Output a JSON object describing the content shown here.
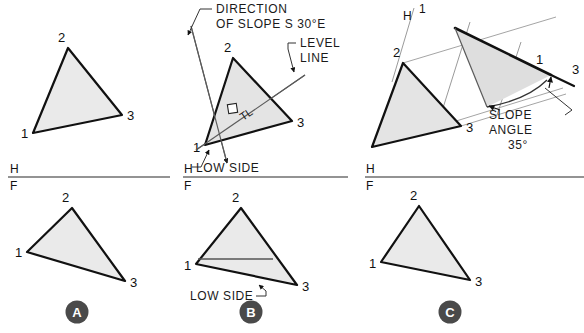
{
  "figure": {
    "panels": [
      {
        "key": "A",
        "badge": "A",
        "caption": "Given plane 1-2-3"
      },
      {
        "key": "B",
        "badge": "B",
        "caption": "Level line and direction of slope"
      },
      {
        "key": "C",
        "badge": "C",
        "caption": "Edge view and slope angle"
      }
    ]
  },
  "colors": {
    "plane_fill": "#e9e9e9",
    "plane_fill_dark": "#dcdcdc",
    "outline": "#111111",
    "thin_line": "#8a8a8a",
    "fold_line": "#6f6f6f",
    "badge_fill": "#4a4a4a",
    "badge_text": "#ffffff",
    "text": "#1a1a1a"
  },
  "vertices": {
    "v1": "1",
    "v2": "2",
    "v3": "3"
  },
  "fold_lines": {
    "h_label": "H",
    "f_label": "F",
    "h1_h_label": "H",
    "h1_one_label": "1"
  },
  "annotations": {
    "direction_of_slope_line1": "DIRECTION",
    "direction_of_slope_line2": "OF SLOPE  S 30°E",
    "level_line_1": "LEVEL",
    "level_line_2": "LINE",
    "true_length": "TL",
    "low_side_top": "LOW SIDE",
    "low_side_bottom": "LOW SIDE",
    "slope_angle_1": "SLOPE",
    "slope_angle_2": "ANGLE",
    "slope_angle_value": "35°"
  },
  "measurements": {
    "bearing": "S 30°E",
    "slope_angle_degrees": "35°"
  },
  "panelA": {
    "top_view": {
      "p1": "33,133",
      "p2": "68,48",
      "p3": "122,115"
    },
    "front_view": {
      "p1": "27,252",
      "p2": "72,208",
      "p3": "125,281"
    }
  },
  "panelB": {
    "top_view": {
      "p1": "205,145",
      "p2": "233,58",
      "p3": "292,121"
    },
    "front_view": {
      "p1": "196,264",
      "p2": "241,208",
      "p3": "297,285"
    }
  },
  "panelC": {
    "top_view": {
      "p1": "372,147",
      "p2": "403,63",
      "p3": "461,126"
    },
    "edge_view": {
      "p1": "551,75",
      "p2": "455,28",
      "p3": "487,107"
    },
    "front_view": {
      "p1": "381,262",
      "p2": "419,206",
      "p3": "470,280"
    }
  }
}
